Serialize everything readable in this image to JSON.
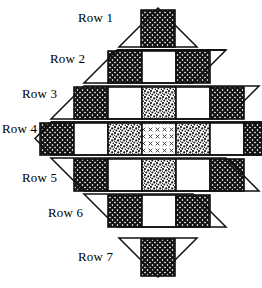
{
  "figure": {
    "shape": "diamond",
    "row_count": 7,
    "colors": {
      "outline": "#1a1a1a",
      "background": "#ffffff",
      "dark_fill": "#2b2b2b",
      "medium_fill": "#5a5a5a",
      "light_fill": "#bdbdbd"
    },
    "patterns": {
      "dark": "dense-crosshatch",
      "medium": "stipple-speckle",
      "light": "sparse-x-hatch",
      "plain": "white-blank"
    }
  },
  "rows": [
    {
      "label": "Row 1",
      "index": 1,
      "shape": "triangle-up",
      "cell_count": 1,
      "cells": [
        "dark"
      ],
      "label_x": 78,
      "label_y": 10
    },
    {
      "label": "Row 2",
      "index": 2,
      "shape": "trapezoid-up",
      "cell_count": 3,
      "cells": [
        "dark",
        "plain",
        "dark"
      ],
      "label_x": 50,
      "label_y": 51
    },
    {
      "label": "Row 3",
      "index": 3,
      "shape": "trapezoid-up",
      "cell_count": 5,
      "cells": [
        "dark",
        "plain",
        "medium",
        "plain",
        "dark"
      ],
      "label_x": 22,
      "label_y": 86
    },
    {
      "label": "Row 4",
      "index": 4,
      "shape": "hexagon-wide",
      "cell_count": 7,
      "cells": [
        "dark",
        "plain",
        "medium",
        "light",
        "medium",
        "plain",
        "dark"
      ],
      "label_x": 2,
      "label_y": 121
    },
    {
      "label": "Row 5",
      "index": 5,
      "shape": "trapezoid-down",
      "cell_count": 5,
      "cells": [
        "dark",
        "plain",
        "medium",
        "plain",
        "dark"
      ],
      "label_x": 22,
      "label_y": 170
    },
    {
      "label": "Row 6",
      "index": 6,
      "shape": "trapezoid-down",
      "cell_count": 3,
      "cells": [
        "dark",
        "plain",
        "dark"
      ],
      "label_x": 48,
      "label_y": 205
    },
    {
      "label": "Row 7",
      "index": 7,
      "shape": "triangle-down",
      "cell_count": 1,
      "cells": [
        "dark"
      ],
      "label_x": 78,
      "label_y": 249
    }
  ]
}
